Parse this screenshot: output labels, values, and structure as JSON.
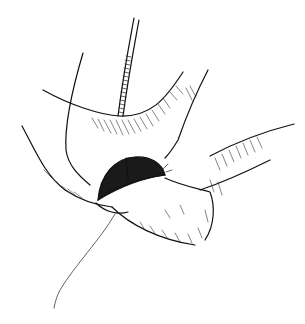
{
  "image": {
    "kind": "line-art illustration",
    "subject": "surgical anastomosis drawing",
    "width": 305,
    "height": 324,
    "background": "#ffffff",
    "ink": "#111111"
  },
  "elements": [
    {
      "name": "catheter-tube",
      "description": "ribbed tube descending from top center into the opening"
    },
    {
      "name": "upper-organ-fold",
      "description": "curved upper tissue fold with hatching"
    },
    {
      "name": "opening",
      "description": "dark crosshatched oval opening with stitches"
    },
    {
      "name": "bowel-segment",
      "description": "textured tubular segment extending to the right"
    },
    {
      "name": "suture-thread",
      "description": "thin thread trailing downward to lower left"
    }
  ]
}
